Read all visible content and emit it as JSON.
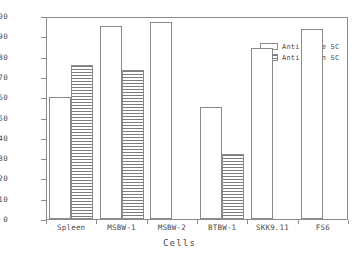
{
  "chart_data": {
    "type": "bar",
    "title": "",
    "xlabel": "Cells",
    "ylabel": "% Inhibition of IgA-Mediated Rosettes",
    "categories": [
      "Spleen",
      "MSBW-1",
      "MSBW-2",
      "BTBW-1",
      "SKK9.11",
      "FS6"
    ],
    "series": [
      {
        "name": "Anti-Mouse SC",
        "values": [
          60,
          95,
          97,
          55,
          84,
          93.5
        ]
      },
      {
        "name": "Anti-Human SC",
        "values": [
          76,
          73.5,
          null,
          32,
          null,
          null
        ]
      }
    ],
    "ylim": [
      0,
      100
    ],
    "yticks": [
      0,
      10,
      20,
      30,
      40,
      50,
      60,
      70,
      80,
      90,
      100
    ],
    "ytick_labels": [
      "0",
      "10",
      "20",
      "30",
      "40",
      "50",
      "60",
      "70",
      "80",
      "90",
      "100"
    ],
    "grid": false,
    "legend_position": "upper right",
    "colors": {
      "axis": "#8c8c8c",
      "text": "#4a4a4a",
      "bar_outline": "#8a8a8a",
      "series_anti_mouse_fill": "#ffffff",
      "series_anti_human_hatch": "#7d7d7d"
    }
  },
  "legend": {
    "entries": [
      {
        "label": "Anti-Mouse SC",
        "style": "solid"
      },
      {
        "label": "Anti-Human SC",
        "style": "hatch"
      }
    ]
  }
}
